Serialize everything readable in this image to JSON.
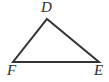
{
  "figure": {
    "kind": "geometry-diagram",
    "shape": "triangle",
    "name": "Triangle DFE",
    "background_color": "#ffffff",
    "stroke_color": "#333333",
    "stroke_width": 2,
    "canvas": {
      "width": 109,
      "height": 82
    },
    "vertices": [
      {
        "id": "D",
        "label": "D",
        "x": 47,
        "y": 19,
        "label_x": 41,
        "label_y": 0,
        "position": "apex-top"
      },
      {
        "id": "F",
        "label": "F",
        "x": 13,
        "y": 62,
        "label_x": 7,
        "label_y": 63,
        "position": "bottom-left"
      },
      {
        "id": "E",
        "label": "E",
        "x": 99,
        "y": 62,
        "label_x": 94,
        "label_y": 63,
        "position": "bottom-right"
      }
    ],
    "edges": [
      {
        "id": "DF",
        "from": "D",
        "to": "F",
        "label": ""
      },
      {
        "id": "DE",
        "from": "D",
        "to": "E",
        "label": ""
      },
      {
        "id": "FE",
        "from": "F",
        "to": "E",
        "label": ""
      }
    ],
    "polygon_points": "47,19 99,62 13,62",
    "labels": {
      "apex": "D",
      "bottom_left": "F",
      "bottom_right": "E"
    }
  }
}
